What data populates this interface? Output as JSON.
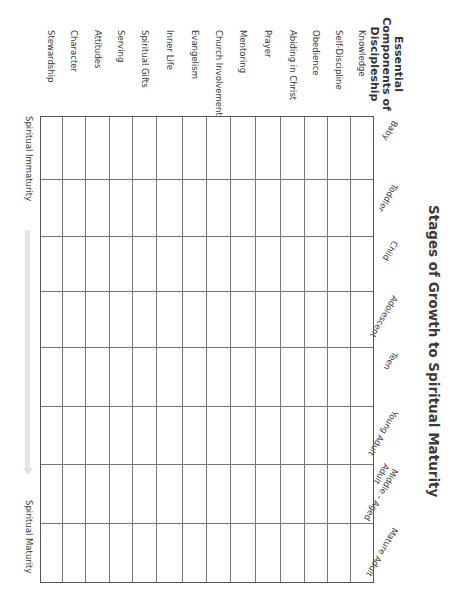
{
  "title": "Stages of Growth to Spiritual Maturity",
  "heading": [
    "Essential",
    "Components of",
    "Discipleship"
  ],
  "components": [
    "Knowledge",
    "Self-Discipline",
    "Obedience",
    "Abiding in Christ",
    "Prayer",
    "Mentoring",
    "Church Involvement",
    "Evangelism",
    "Inner Life",
    "Spiritual Gifts",
    "Serving",
    "Attitudes",
    "Character",
    "Stewardship"
  ],
  "stages": [
    "Baby",
    "Toddler",
    "Child",
    "Adolescent",
    "Teen",
    "Young Adult",
    "Middle - Aged Adult",
    "Mature Adult"
  ],
  "axis": {
    "start": "Spiritual Immaturity",
    "end": "Spiritual Maturity"
  },
  "layout": {
    "rows_y": [
      88,
      111,
      134,
      157,
      181,
      206,
      231,
      255,
      279,
      305,
      329,
      352,
      376,
      399,
      422
    ],
    "cols_x": [
      116,
      179,
      236,
      291,
      347,
      406,
      464,
      523,
      583
    ]
  }
}
